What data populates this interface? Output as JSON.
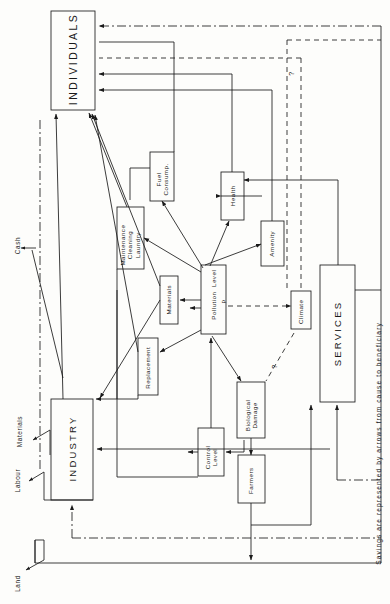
{
  "diagram": {
    "type": "flow-diagram",
    "orientation": "rotated-90-ccw",
    "caption": "Savings are represented by arrows from cause to beneficiary",
    "colors": {
      "ink": "#1a1a1a",
      "paper": "#fdfdfb"
    },
    "actors": [
      {
        "id": "individuals",
        "label": "INDIVIDUALS"
      },
      {
        "id": "industry",
        "label": "INDUSTRY"
      },
      {
        "id": "services",
        "label": "SERVICES"
      }
    ],
    "nodes": [
      {
        "id": "fuel",
        "label": "Fuel\nConsump."
      },
      {
        "id": "health",
        "label": "Health"
      },
      {
        "id": "amenity",
        "label": "Amenity"
      },
      {
        "id": "maintenance",
        "label": "Maintenance\nCleaning\nLaundry"
      },
      {
        "id": "materials",
        "label": "Materials"
      },
      {
        "id": "pollution",
        "label": "Pollution  Level"
      },
      {
        "id": "climate",
        "label": "Climate"
      },
      {
        "id": "replacement",
        "label": "Replacement"
      },
      {
        "id": "control",
        "label": "Control\nLevel"
      },
      {
        "id": "biological",
        "label": "Biological\nDamage"
      },
      {
        "id": "farmers",
        "label": "Farmers"
      }
    ],
    "edge_labels": [
      {
        "id": "cash",
        "label": "Cash"
      },
      {
        "id": "materials",
        "label": "Materials"
      },
      {
        "id": "labour",
        "label": "Labour"
      },
      {
        "id": "land",
        "label": "Land"
      }
    ],
    "annotations": [
      {
        "id": "q-climate-top",
        "label": "?"
      },
      {
        "id": "q-climate-bio",
        "label": "?"
      },
      {
        "id": "p-pollution",
        "label": "p"
      }
    ]
  }
}
